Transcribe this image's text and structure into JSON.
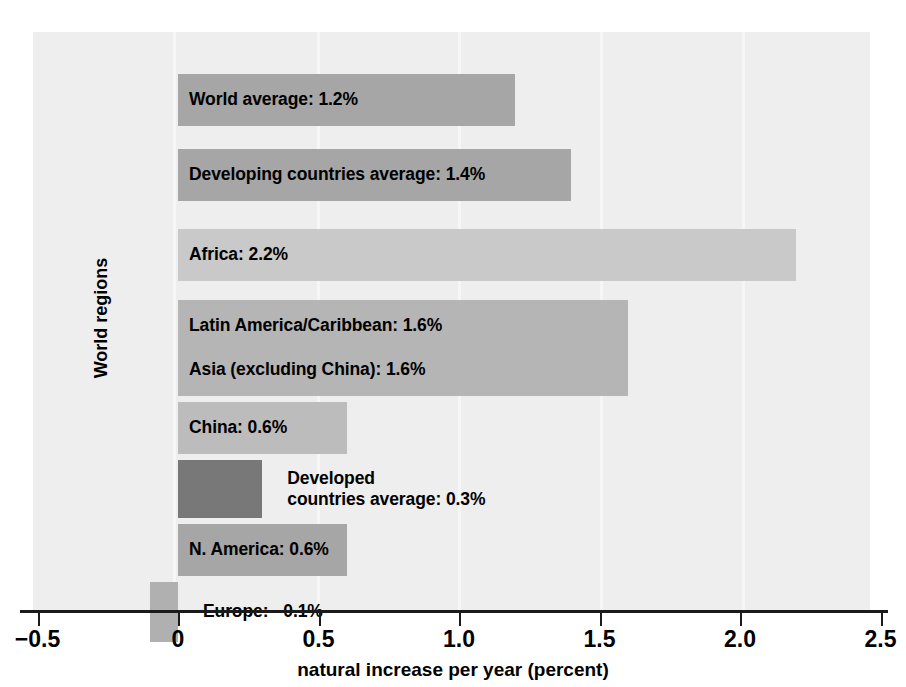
{
  "chart_data": {
    "type": "bar",
    "orientation": "horizontal",
    "title": "",
    "xlabel": "natural increase per year (percent)",
    "ylabel": "World regions",
    "xlim": [
      -0.5,
      2.5
    ],
    "xticks": [
      "−0.5",
      "0",
      "0.5",
      "1.0",
      "1.5",
      "2.0",
      "2.5"
    ],
    "xtick_values": [
      -0.5,
      0,
      0.5,
      1.0,
      1.5,
      2.0,
      2.5
    ],
    "grid": false,
    "legend": "none",
    "categories": [
      "World average",
      "Developing countries average",
      "Africa",
      "Latin America/Caribbean",
      "Asia (excluding China)",
      "China",
      "Developed countries average",
      "N. America",
      "Europe"
    ],
    "values": [
      1.2,
      1.4,
      2.2,
      1.6,
      1.6,
      0.6,
      0.3,
      0.6,
      -0.1
    ],
    "bars": [
      {
        "label": "World average: 1.2%",
        "label_lines": [
          "World average: 1.2%"
        ],
        "value": 1.2,
        "color": "#a6a6a6",
        "top": 42,
        "height": 52,
        "label_inside": true
      },
      {
        "label": "Developing countries average: 1.4%",
        "label_lines": [
          "Developing countries average: 1.4%"
        ],
        "value": 1.4,
        "color": "#a6a6a6",
        "top": 117,
        "height": 52,
        "label_inside": true
      },
      {
        "label": "Africa: 2.2%",
        "label_lines": [
          "Africa: 2.2%"
        ],
        "value": 2.2,
        "color": "#c9c9c9",
        "top": 197,
        "height": 52,
        "label_inside": true
      },
      {
        "label": "Latin America/Caribbean: 1.6%",
        "label_lines": [
          "Latin America/Caribbean: 1.6%"
        ],
        "value": 1.6,
        "color": "#b5b5b5",
        "top": 268,
        "height": 52,
        "label_inside": true
      },
      {
        "label": "Asia (excluding China): 1.6%",
        "label_lines": [
          "Asia (excluding China): 1.6%"
        ],
        "value": 1.6,
        "color": "#b5b5b5",
        "top": 312,
        "height": 52,
        "label_inside": true
      },
      {
        "label": "China: 0.6%",
        "label_lines": [
          "China: 0.6%"
        ],
        "value": 0.6,
        "color": "#bcbcbc",
        "top": 370,
        "height": 52,
        "label_inside": true
      },
      {
        "label": "Developed countries average: 0.3%",
        "label_lines": [
          "Developed",
          "countries average: 0.3%"
        ],
        "value": 0.3,
        "color": "#787878",
        "top": 428,
        "height": 58,
        "label_inside": false
      },
      {
        "label": "N. America: 0.6%",
        "label_lines": [
          "N. America: 0.6%"
        ],
        "value": 0.6,
        "color": "#a6a6a6",
        "top": 492,
        "height": 52,
        "label_inside": true
      },
      {
        "label": "Europe:  −0.1%",
        "label_lines": [
          "Europe:  −0.1%"
        ],
        "value": -0.1,
        "color": "#b0b0b0",
        "top": 550,
        "height": 60,
        "label_inside": false
      }
    ]
  },
  "colors": {
    "panel_background": "#eeeeee",
    "page_background": "#ffffff",
    "axis": "#1a1a1a",
    "text": "#000000"
  }
}
